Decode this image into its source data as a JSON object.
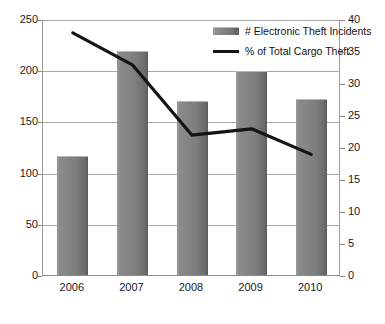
{
  "chart_data": {
    "type": "bar",
    "title": "",
    "subtitle": "",
    "xlabel": "",
    "ylabel": "",
    "categories": [
      "2006",
      "2007",
      "2008",
      "2009",
      "2010"
    ],
    "series": [
      {
        "name": "# Electronic Theft Incidents",
        "type": "bar",
        "axis": "left",
        "color": "#7e7e7e",
        "values": [
          117,
          220,
          171,
          200,
          173
        ]
      },
      {
        "name": "% of Total Cargo Theft",
        "type": "line",
        "axis": "right",
        "color": "#141414",
        "values": [
          38,
          33,
          22,
          23,
          19
        ]
      }
    ],
    "left_axis": {
      "ylim": [
        0,
        250
      ],
      "ticks": [
        "0",
        "50",
        "100",
        "150",
        "200",
        "250"
      ],
      "tick_values": [
        0,
        50,
        100,
        150,
        200,
        250
      ]
    },
    "right_axis": {
      "ylim": [
        0,
        40
      ],
      "ticks": [
        "0",
        "5",
        "10",
        "15",
        "20",
        "25",
        "30",
        "35",
        "40"
      ],
      "tick_values": [
        0,
        5,
        10,
        15,
        20,
        25,
        30,
        35,
        40
      ]
    },
    "grid": true,
    "legend_position": "top-right"
  },
  "legend": {
    "entries": [
      {
        "label": "# Electronic Theft Incidents",
        "swatch": "bar-swatch"
      },
      {
        "label": "% of Total Cargo Theft",
        "swatch": "line-swatch"
      }
    ]
  },
  "colors": {
    "bar_fill": "#7e7e7e",
    "line": "#141414",
    "grid": "#a8a8a8",
    "axis": "#8a8a8a",
    "text": "#1a1a1a",
    "background": "#ffffff"
  }
}
